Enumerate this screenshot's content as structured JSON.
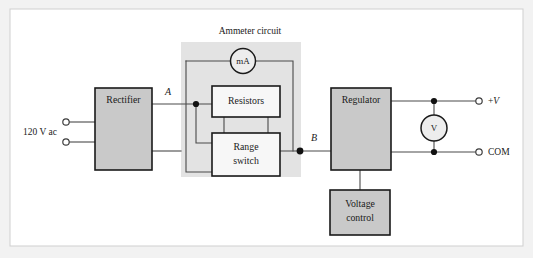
{
  "figure": {
    "kind": "block-diagram",
    "frame": {
      "page_bg": "#f2f2f2",
      "content_bg": "#ffffff",
      "border_color": "#bfbfbf"
    },
    "panel": {
      "title": "Ammeter circuit",
      "fill": "#e3e3e3"
    },
    "blocks": [
      {
        "id": "rectifier",
        "label": "Rectifier",
        "style": "filled",
        "fill": "#c9c9c9"
      },
      {
        "id": "resistors",
        "label": "Resistors",
        "style": "open",
        "fill": "#f7f7f7"
      },
      {
        "id": "range-switch",
        "label_line1": "Range",
        "label_line2": "switch",
        "style": "open",
        "fill": "#f7f7f7"
      },
      {
        "id": "regulator",
        "label": "Regulator",
        "style": "filled",
        "fill": "#c9c9c9"
      },
      {
        "id": "voltage-control",
        "label_line1": "Voltage",
        "label_line2": "control",
        "style": "filled",
        "fill": "#c9c9c9"
      }
    ],
    "meters": [
      {
        "id": "milliammeter",
        "label": "mA",
        "shape": "circle"
      },
      {
        "id": "voltmeter",
        "label": "V",
        "shape": "circle"
      }
    ],
    "node_labels": [
      {
        "id": "node-a",
        "label": "A",
        "italic": true
      },
      {
        "id": "node-b",
        "label": "B",
        "italic": true
      }
    ],
    "source": {
      "label": "120 V ac",
      "terminal_count": 2
    },
    "output_terminals": [
      {
        "id": "plus-v",
        "label_prefix": "+",
        "label_symbol": "V",
        "label": "+V"
      },
      {
        "id": "com",
        "label": "COM"
      }
    ],
    "colors": {
      "wire": "#4a4a4a",
      "outline": "#1a1a1a",
      "node_dot": "#111111",
      "block_fill": "#c9c9c9",
      "panel_fill": "#e3e3e3",
      "meter_fill": "#ededed"
    }
  }
}
